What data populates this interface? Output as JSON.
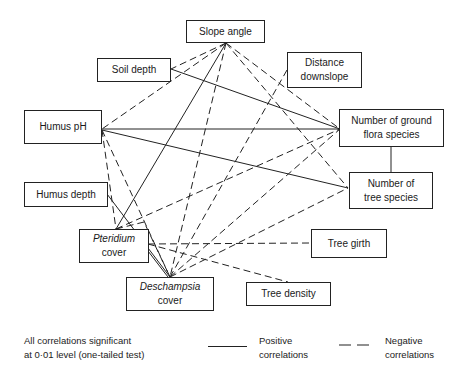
{
  "diagram": {
    "nodes": {
      "slope_angle": {
        "label": "Slope angle",
        "x": 186,
        "y": 20,
        "w": 79,
        "h": 23
      },
      "soil_depth": {
        "label": "Soil depth",
        "x": 97,
        "y": 58,
        "w": 74,
        "h": 24
      },
      "distance": {
        "label_line1": "Distance",
        "label_line2": "downslope",
        "x": 287,
        "y": 52,
        "w": 75,
        "h": 36
      },
      "humus_ph": {
        "label": "Humus pH",
        "x": 24,
        "y": 110,
        "w": 78,
        "h": 34
      },
      "ground_flora": {
        "label_line1": "Number of ground",
        "label_line2": "flora species",
        "x": 339,
        "y": 109,
        "w": 105,
        "h": 38
      },
      "tree_species": {
        "label_line1": "Number of",
        "label_line2": "tree species",
        "x": 349,
        "y": 172,
        "w": 84,
        "h": 37
      },
      "humus_depth": {
        "label": "Humus depth",
        "x": 24,
        "y": 182,
        "w": 84,
        "h": 25
      },
      "pteridium": {
        "label_line1": "Pteridium",
        "label_line2": "cover",
        "x": 79,
        "y": 229,
        "w": 70,
        "h": 34
      },
      "tree_girth": {
        "label": "Tree girth",
        "x": 311,
        "y": 229,
        "w": 76,
        "h": 29
      },
      "deschampsia": {
        "label_line1": "Deschampsia",
        "label_line2": "cover",
        "x": 126,
        "y": 277,
        "w": 88,
        "h": 34
      },
      "tree_density": {
        "label": "Tree density",
        "x": 246,
        "y": 282,
        "w": 85,
        "h": 24
      }
    },
    "edges": [
      {
        "from": "soil_depth",
        "to": "ground_flora",
        "type": "positive",
        "p1": [
          171,
          69
        ],
        "p2": [
          340,
          129
        ]
      },
      {
        "from": "humus_ph",
        "to": "ground_flora",
        "type": "positive",
        "p1": [
          102,
          129
        ],
        "p2": [
          340,
          129
        ]
      },
      {
        "from": "humus_ph",
        "to": "tree_species",
        "type": "positive",
        "p1": [
          102,
          130
        ],
        "p2": [
          348,
          188
        ]
      },
      {
        "from": "slope_angle",
        "to": "pteridium",
        "type": "positive",
        "p1": [
          226,
          43
        ],
        "p2": [
          116,
          229
        ]
      },
      {
        "from": "ground_flora",
        "to": "tree_species",
        "type": "positive",
        "p1": [
          391,
          147
        ],
        "p2": [
          391,
          172
        ]
      },
      {
        "from": "humus_depth",
        "to": "deschampsia",
        "type": "positive",
        "p1": [
          107,
          194
        ],
        "p2": [
          170,
          277
        ]
      },
      {
        "from": "pteridium",
        "to": "deschampsia",
        "type": "positive",
        "p1": [
          148,
          251
        ],
        "p2": [
          168,
          277
        ]
      },
      {
        "from": "slope_angle",
        "to": "soil_depth",
        "type": "negative",
        "p1": [
          226,
          43
        ],
        "p2": [
          171,
          69
        ]
      },
      {
        "from": "slope_angle",
        "to": "humus_ph",
        "type": "negative",
        "p1": [
          226,
          43
        ],
        "p2": [
          102,
          129
        ]
      },
      {
        "from": "slope_angle",
        "to": "deschampsia",
        "type": "negative",
        "p1": [
          226,
          43
        ],
        "p2": [
          170,
          277
        ]
      },
      {
        "from": "slope_angle",
        "to": "ground_flora",
        "type": "negative",
        "p1": [
          226,
          43
        ],
        "p2": [
          340,
          129
        ]
      },
      {
        "from": "slope_angle",
        "to": "tree_species",
        "type": "negative",
        "p1": [
          226,
          43
        ],
        "p2": [
          348,
          188
        ]
      },
      {
        "from": "distance",
        "to": "deschampsia",
        "type": "negative",
        "p1": [
          287,
          70
        ],
        "p2": [
          170,
          277
        ]
      },
      {
        "from": "humus_ph",
        "to": "pteridium",
        "type": "negative",
        "p1": [
          102,
          130
        ],
        "p2": [
          116,
          229
        ]
      },
      {
        "from": "humus_ph",
        "to": "deschampsia",
        "type": "negative",
        "p1": [
          102,
          130
        ],
        "p2": [
          170,
          277
        ]
      },
      {
        "from": "pteridium",
        "to": "ground_flora",
        "type": "negative",
        "p1": [
          116,
          229
        ],
        "p2": [
          340,
          129
        ]
      },
      {
        "from": "pteridium",
        "to": "tree_girth",
        "type": "negative",
        "p1": [
          148,
          244
        ],
        "p2": [
          311,
          243
        ]
      },
      {
        "from": "pteridium",
        "to": "tree_density",
        "type": "negative",
        "p1": [
          148,
          244
        ],
        "p2": [
          288,
          282
        ]
      },
      {
        "from": "deschampsia",
        "to": "ground_flora",
        "type": "negative",
        "p1": [
          170,
          277
        ],
        "p2": [
          340,
          129
        ]
      },
      {
        "from": "deschampsia",
        "to": "tree_species",
        "type": "negative",
        "p1": [
          170,
          277
        ],
        "p2": [
          348,
          188
        ]
      },
      {
        "from": "pteridium",
        "to": "deschampsia",
        "type": "negative",
        "p1": [
          116,
          229
        ],
        "p2": [
          170,
          277
        ],
        "via": [
          144,
          222
        ]
      }
    ]
  },
  "legend": {
    "note_line1": "All correlations significant",
    "note_line2": "at 0·01 level (one-tailed test)",
    "positive_line1": "Positive",
    "positive_line2": "correlations",
    "negative_line1": "Negative",
    "negative_line2": "correlations"
  },
  "colors": {
    "line": "#222222",
    "background": "#ffffff"
  }
}
